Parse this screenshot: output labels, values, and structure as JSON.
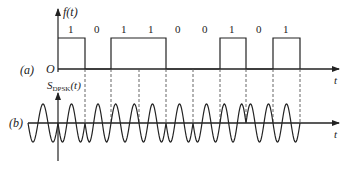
{
  "figure": {
    "panel_a_label": "(a)",
    "panel_b_label": "(b)",
    "panel_a_ylabel": "f(t)",
    "panel_b_ylabel_main": "S",
    "panel_b_ylabel_sub": "DPSK",
    "panel_b_ylabel_tail": "(t)",
    "origin_label": "O",
    "x_axis_label_a": "t",
    "x_axis_label_b": "t",
    "bits": [
      "1",
      "0",
      "1",
      "1",
      "0",
      "0",
      "1",
      "0",
      "1"
    ],
    "colors": {
      "line": "#222222",
      "dashed": "#555555",
      "background": "#ffffff"
    }
  }
}
